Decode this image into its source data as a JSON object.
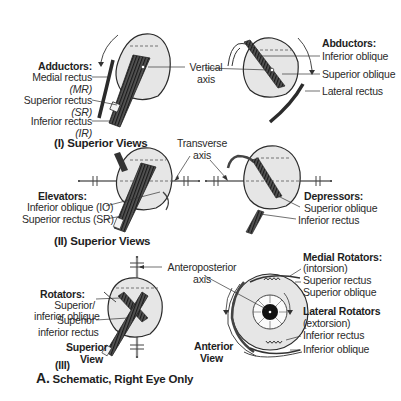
{
  "figure": {
    "caption_letter": "A.",
    "caption_text": "Schematic, Right Eye Only",
    "colors": {
      "eyeball_fill": "#e4e4e4",
      "outline": "#2b2b2b",
      "muscle_dark": "#3a3a3a",
      "text": "#2a2a2a"
    }
  },
  "panel1": {
    "caption": "(I) Superior Views",
    "axis_label_line1": "Vertical",
    "axis_label_line2": "axis",
    "left_group": {
      "title": "Adductors:",
      "items": [
        {
          "name": "Medial rectus",
          "abbr": "(MR)"
        },
        {
          "name": "Superior rectus",
          "abbr": "(SR)"
        },
        {
          "name": "Inferior rectus",
          "abbr": "(IR)"
        }
      ]
    },
    "right_group": {
      "title": "Abductors:",
      "items": [
        "Inferior oblique",
        "Superior oblique",
        "Lateral rectus"
      ]
    }
  },
  "panel2": {
    "caption": "(II) Superior Views",
    "axis_label_line1": "Transverse",
    "axis_label_line2": "axis",
    "left_group": {
      "title": "Elevators:",
      "items": [
        "Inferior oblique (IO)",
        "Superior rectus (SR)"
      ]
    },
    "right_group": {
      "title": "Depressors:",
      "items": [
        "Superior oblique",
        "Inferior rectus"
      ]
    }
  },
  "panel3": {
    "caption_num": "(III)",
    "view_line1": "Superior",
    "view_line2": "View",
    "axis_label_line1": "Anteroposterior",
    "axis_label_line2": "axis",
    "left_group": {
      "title": "Rotators:",
      "items": [
        "Superior/",
        "inferior oblique",
        "Superior",
        "inferior rectus"
      ]
    },
    "anterior_line1": "Anterior",
    "anterior_line2": "View",
    "medial": {
      "title": "Medial Rotators:",
      "subtitle": "(intorsion)",
      "items": [
        "Superior rectus",
        "Superior oblique"
      ]
    },
    "lateral": {
      "title": "Lateral Rotators",
      "subtitle": "(extorsion)",
      "items": [
        "Inferior rectus",
        "Inferior oblique"
      ]
    }
  }
}
